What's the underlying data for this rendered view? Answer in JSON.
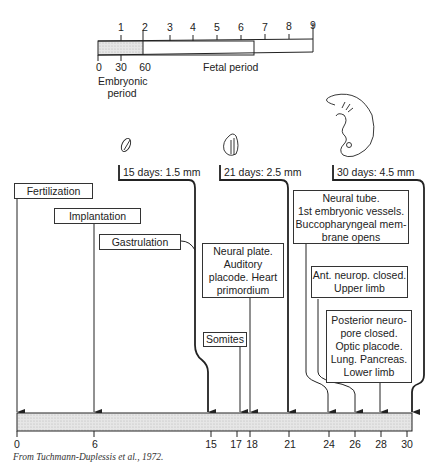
{
  "top_scale": {
    "month_ticks": [
      "1",
      "2",
      "3",
      "4",
      "5",
      "6",
      "7",
      "8",
      "9"
    ],
    "day_ticks": [
      "0",
      "30",
      "60"
    ],
    "embryonic_label_line1": "Embryonic",
    "embryonic_label_line2": "period",
    "fetal_label": "Fetal period"
  },
  "stages": [
    {
      "label": "15 days: 1.5 mm"
    },
    {
      "label": "21 days: 2.5 mm"
    },
    {
      "label": "30 days: 4.5 mm"
    }
  ],
  "events": {
    "fertilization": "Fertilization",
    "implantation": "Implantation",
    "gastrulation": "Gastrulation",
    "neural_plate": [
      "Neural plate.",
      "Auditory",
      "placode. Heart",
      "primordium"
    ],
    "somites": "Somites",
    "neural_tube": [
      "Neural tube.",
      "1st embryonic vessels.",
      "Buccopharyngeal mem-",
      "brane opens"
    ],
    "ant_neurop": [
      "Ant. neurop. closed.",
      "Upper limb"
    ],
    "posterior_neuro": [
      "Posterior neuro-",
      "pore closed.",
      "Optic placode.",
      "Lung. Pancreas.",
      "Lower limb"
    ]
  },
  "bottom_axis": {
    "ticks": [
      "0",
      "6",
      "15",
      "17",
      "18",
      "21",
      "24",
      "26",
      "28",
      "30"
    ]
  },
  "caption": "From Tuchmann-Duplessis et al., 1972.",
  "colors": {
    "line": "#222222",
    "shade": "#d9d9d9"
  }
}
